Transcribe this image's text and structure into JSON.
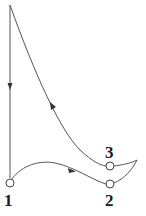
{
  "diagram": {
    "type": "cycle-curve",
    "stroke_color": "#333333",
    "nodes": [
      {
        "id": "1",
        "label": "1"
      },
      {
        "id": "2",
        "label": "2"
      },
      {
        "id": "3",
        "label": "3"
      }
    ],
    "edges": [
      {
        "from": "top",
        "to": "1",
        "direction": "down"
      },
      {
        "from": "1",
        "to": "2",
        "direction": "right"
      },
      {
        "from": "3",
        "to": "top",
        "direction": "up-left"
      }
    ]
  }
}
